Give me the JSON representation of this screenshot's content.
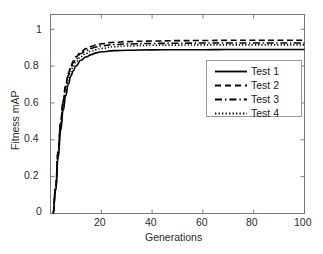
{
  "chart_data": {
    "type": "line",
    "title": "",
    "xlabel": "Generations",
    "ylabel": "Fitness mAP",
    "xlim": [
      0,
      100
    ],
    "ylim": [
      0,
      1.08
    ],
    "grid": false,
    "legend_position": "right",
    "xticks": [
      "20",
      "40",
      "60",
      "80",
      "100"
    ],
    "xtick_values": [
      20,
      40,
      60,
      80,
      100
    ],
    "yticks": [
      "0",
      "0.2",
      "0.4",
      "0.6",
      "0.8",
      "1"
    ],
    "ytick_values": [
      0,
      0.2,
      0.4,
      0.6,
      0.8,
      1
    ],
    "x": [
      1,
      2,
      3,
      4,
      5,
      6,
      7,
      8,
      9,
      10,
      12,
      14,
      16,
      18,
      20,
      25,
      30,
      40,
      50,
      60,
      70,
      80,
      90,
      100
    ],
    "series": [
      {
        "name": "Test 1",
        "style": "solid",
        "color": "#000000",
        "values": [
          0.0,
          0.12,
          0.3,
          0.45,
          0.56,
          0.64,
          0.7,
          0.745,
          0.775,
          0.8,
          0.832,
          0.85,
          0.862,
          0.872,
          0.878,
          0.884,
          0.886,
          0.888,
          0.889,
          0.889,
          0.89,
          0.89,
          0.89,
          0.89
        ]
      },
      {
        "name": "Test 2",
        "style": "dashed",
        "color": "#000000",
        "values": [
          0.0,
          0.14,
          0.34,
          0.5,
          0.615,
          0.7,
          0.76,
          0.8,
          0.828,
          0.85,
          0.878,
          0.895,
          0.907,
          0.915,
          0.921,
          0.929,
          0.933,
          0.936,
          0.938,
          0.939,
          0.94,
          0.94,
          0.94,
          0.94
        ]
      },
      {
        "name": "Test 3",
        "style": "dashdot",
        "color": "#000000",
        "values": [
          0.0,
          0.135,
          0.33,
          0.49,
          0.605,
          0.688,
          0.748,
          0.79,
          0.818,
          0.84,
          0.868,
          0.884,
          0.896,
          0.904,
          0.91,
          0.917,
          0.92,
          0.923,
          0.924,
          0.925,
          0.925,
          0.925,
          0.925,
          0.925
        ]
      },
      {
        "name": "Test 4",
        "style": "dotted",
        "color": "#000000",
        "values": [
          0.0,
          0.13,
          0.32,
          0.475,
          0.588,
          0.67,
          0.73,
          0.772,
          0.8,
          0.823,
          0.852,
          0.869,
          0.881,
          0.889,
          0.896,
          0.905,
          0.909,
          0.913,
          0.914,
          0.915,
          0.915,
          0.915,
          0.915,
          0.915
        ]
      }
    ],
    "legend": [
      {
        "label": "Test 1",
        "style": "solid"
      },
      {
        "label": "Test 2",
        "style": "dashed"
      },
      {
        "label": "Test 3",
        "style": "dashdot"
      },
      {
        "label": "Test 4",
        "style": "dotted"
      }
    ]
  }
}
